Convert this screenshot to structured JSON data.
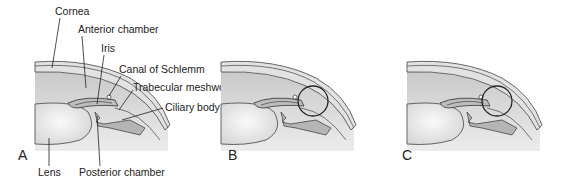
{
  "figure": {
    "panels": [
      {
        "id": "A",
        "letter": "A",
        "x_offset": 0
      },
      {
        "id": "B",
        "letter": "B",
        "x_offset": 186
      },
      {
        "id": "C",
        "letter": "C",
        "x_offset": 372
      }
    ],
    "labels": {
      "cornea": "Cornea",
      "anterior_chamber": "Anterior chamber",
      "iris": "Iris",
      "canal_of_schlemm": "Canal of Schlemm",
      "trabecular_meshwork": "Trabecular meshwork",
      "ciliary_body": "Ciliary body",
      "lens": "Lens",
      "posterior_chamber": "Posterior chamber"
    },
    "colors": {
      "background": "#ffffff",
      "tissue_light": "#e6e6e6",
      "tissue_mid": "#cfcfcf",
      "outline": "#333333"
    }
  }
}
